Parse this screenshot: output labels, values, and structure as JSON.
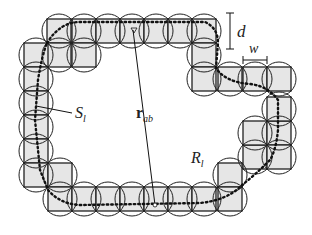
{
  "figure": {
    "labels": {
      "d": "d",
      "w": "w",
      "S": "S",
      "S_sub": "l",
      "r": "r",
      "r_sub": "ab",
      "R": "R",
      "R_sub": "l"
    },
    "colors": {
      "square_fill": "#e6e6e6",
      "stroke": "#222222",
      "background": "#ffffff"
    },
    "cell_size_px": 24
  }
}
